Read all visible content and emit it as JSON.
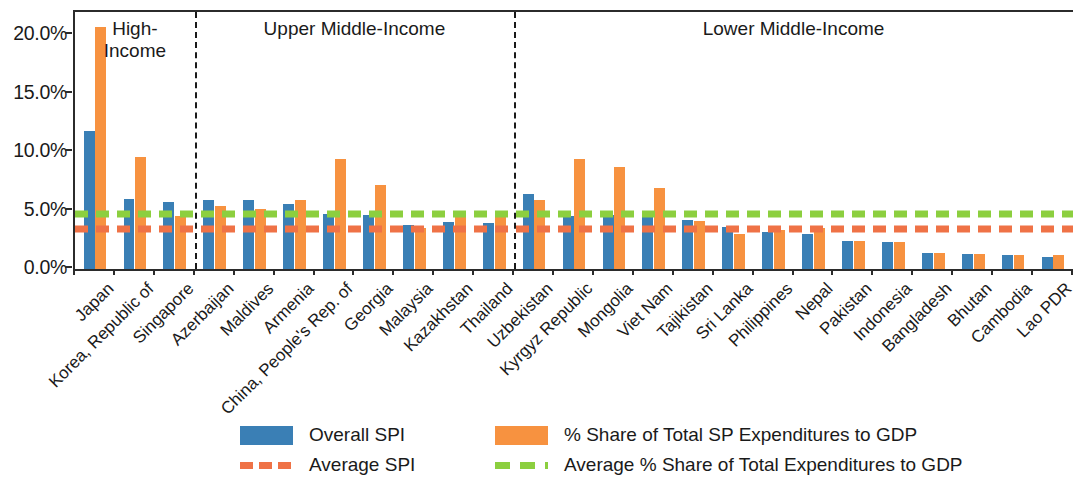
{
  "chart_data": {
    "type": "bar",
    "title": "",
    "xlabel": "",
    "ylabel": "",
    "ylim": [
      0,
      22
    ],
    "grid": false,
    "legend_position": "bottom",
    "ytick_labels": [
      "0.0%",
      "5.0%",
      "10.0%",
      "15.0%",
      "20.0%"
    ],
    "ytick_values": [
      0,
      5,
      10,
      15,
      20
    ],
    "categories": [
      "Japan",
      "Korea, Republic of",
      "Singapore",
      "Azerbaijan",
      "Maldives",
      "Armenia",
      "China, People's Rep. of",
      "Georgia",
      "Malaysia",
      "Kazakhstan",
      "Thailand",
      "Uzbekistan",
      "Kyrgyz Republic",
      "Mongolia",
      "Viet Nam",
      "Tajikistan",
      "Sri Lanka",
      "Philippines",
      "Nepal",
      "Pakistan",
      "Indonesia",
      "Bangladesh",
      "Bhutan",
      "Cambodia",
      "Lao PDR"
    ],
    "series": [
      {
        "name": "Overall SPI",
        "color": "#3a7fb5",
        "values": [
          11.8,
          6.0,
          5.7,
          5.9,
          5.9,
          5.6,
          4.7,
          4.6,
          3.8,
          4.0,
          3.9,
          6.4,
          4.5,
          4.6,
          4.5,
          4.2,
          3.6,
          3.2,
          3.0,
          2.4,
          2.3,
          1.4,
          1.3,
          1.2,
          1.0
        ]
      },
      {
        "name": "% Share of Total SP Expenditures to GDP",
        "color": "#f79240",
        "values": [
          20.7,
          9.6,
          4.5,
          5.4,
          5.1,
          5.9,
          9.4,
          7.2,
          3.5,
          4.7,
          4.5,
          5.9,
          9.4,
          8.7,
          6.9,
          4.1,
          3.0,
          3.3,
          3.5,
          2.4,
          2.3,
          1.4,
          1.3,
          1.2,
          1.2
        ]
      }
    ],
    "reference_lines": [
      {
        "name": "Average SPI",
        "color": "#ef7246",
        "value": 4.0,
        "style": "dashed"
      },
      {
        "name": "Average % Share of Total Expenditures to GDP",
        "color": "#8ccf3f",
        "value": 5.3,
        "style": "dashed"
      }
    ],
    "groups": [
      {
        "label": "High-\nIncome",
        "start": 0,
        "end": 2
      },
      {
        "label": "Upper Middle-Income",
        "start": 3,
        "end": 10
      },
      {
        "label": "Lower Middle-Income",
        "start": 11,
        "end": 24
      }
    ]
  },
  "legend": {
    "items": [
      {
        "label": "Overall SPI",
        "icon": "blue-bar-swatch"
      },
      {
        "label": "% Share of Total SP Expenditures to GDP",
        "icon": "orange-bar-swatch"
      },
      {
        "label": "Average SPI",
        "icon": "orange-dashed-line-swatch"
      },
      {
        "label": "Average % Share of Total Expenditures to GDP",
        "icon": "green-dashed-line-swatch"
      }
    ]
  }
}
